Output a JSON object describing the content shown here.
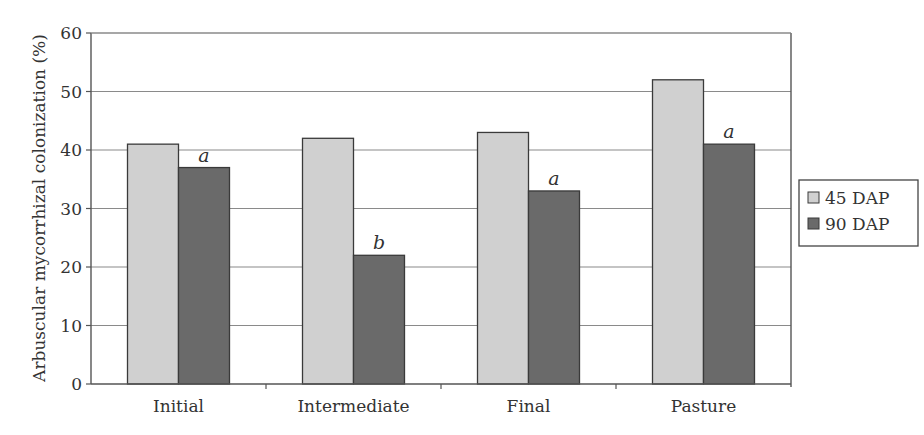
{
  "chart_data": {
    "type": "bar",
    "title": "",
    "xlabel": "",
    "ylabel": "Arbuscular mycorrhizal colonization (%)",
    "ylim": [
      0,
      60
    ],
    "yticks": [
      0,
      10,
      20,
      30,
      40,
      50,
      60
    ],
    "grid": true,
    "legend_position": "right",
    "categories": [
      "Initial",
      "Intermediate",
      "Final",
      "Pasture"
    ],
    "series": [
      {
        "name": "45 DAP",
        "color": "#d0d0d0",
        "values": [
          41,
          42,
          43,
          52
        ]
      },
      {
        "name": "90 DAP",
        "color": "#6a6a6a",
        "values": [
          37,
          22,
          33,
          41
        ]
      }
    ],
    "annotations": [
      {
        "category": "Initial",
        "series": "90 DAP",
        "text": "a"
      },
      {
        "category": "Intermediate",
        "series": "90 DAP",
        "text": "b"
      },
      {
        "category": "Final",
        "series": "90 DAP",
        "text": "a"
      },
      {
        "category": "Pasture",
        "series": "90 DAP",
        "text": "a"
      }
    ]
  }
}
